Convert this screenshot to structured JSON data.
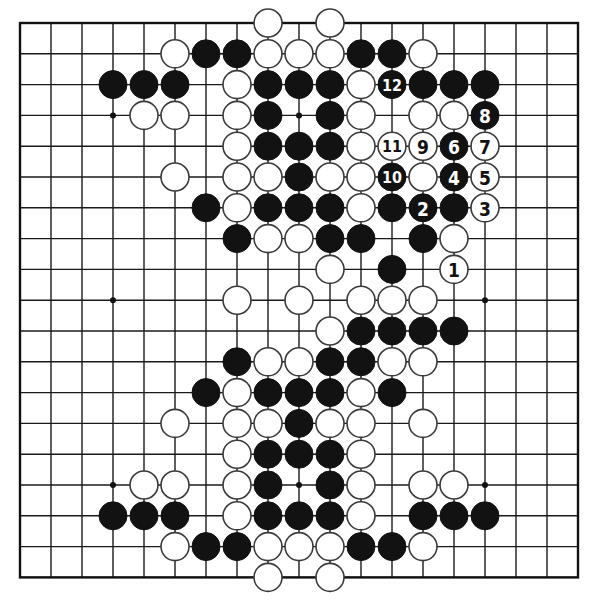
{
  "board": {
    "size": 19,
    "origin_x": 20,
    "origin_y": 23,
    "spacing_x": 31.0,
    "spacing_y": 30.8,
    "stone_radius": 14,
    "colors": {
      "black": "#121212",
      "white": "#ffffff",
      "line": "#1a1a1a",
      "background": "#ffffff"
    },
    "star_points": [
      [
        3,
        3
      ],
      [
        9,
        3
      ],
      [
        15,
        3
      ],
      [
        3,
        9
      ],
      [
        9,
        9
      ],
      [
        15,
        9
      ],
      [
        3,
        15
      ],
      [
        9,
        15
      ],
      [
        15,
        15
      ]
    ],
    "visible_star_points": [
      [
        3,
        3
      ],
      [
        9,
        3
      ],
      [
        3,
        9
      ],
      [
        15,
        9
      ],
      [
        3,
        15
      ],
      [
        9,
        15
      ],
      [
        15,
        15
      ]
    ]
  },
  "stones": {
    "black": [
      [
        6,
        1
      ],
      [
        7,
        1
      ],
      [
        11,
        1
      ],
      [
        12,
        1
      ],
      [
        3,
        2
      ],
      [
        4,
        2
      ],
      [
        5,
        2
      ],
      [
        8,
        2
      ],
      [
        9,
        2
      ],
      [
        10,
        2
      ],
      [
        13,
        2
      ],
      [
        14,
        2
      ],
      [
        15,
        2
      ],
      [
        8,
        3
      ],
      [
        10,
        3
      ],
      [
        8,
        4
      ],
      [
        9,
        4
      ],
      [
        10,
        4
      ],
      [
        9,
        5
      ],
      [
        6,
        6
      ],
      [
        8,
        6
      ],
      [
        9,
        6
      ],
      [
        10,
        6
      ],
      [
        12,
        6
      ],
      [
        14,
        6
      ],
      [
        7,
        7
      ],
      [
        10,
        7
      ],
      [
        11,
        7
      ],
      [
        13,
        7
      ],
      [
        12,
        8
      ],
      [
        11,
        10
      ],
      [
        12,
        10
      ],
      [
        13,
        10
      ],
      [
        14,
        10
      ],
      [
        7,
        11
      ],
      [
        10,
        11
      ],
      [
        11,
        11
      ],
      [
        6,
        12
      ],
      [
        8,
        12
      ],
      [
        9,
        12
      ],
      [
        10,
        12
      ],
      [
        12,
        12
      ],
      [
        9,
        13
      ],
      [
        8,
        14
      ],
      [
        9,
        14
      ],
      [
        10,
        14
      ],
      [
        8,
        15
      ],
      [
        10,
        15
      ],
      [
        3,
        16
      ],
      [
        4,
        16
      ],
      [
        5,
        16
      ],
      [
        8,
        16
      ],
      [
        9,
        16
      ],
      [
        10,
        16
      ],
      [
        13,
        16
      ],
      [
        14,
        16
      ],
      [
        15,
        16
      ],
      [
        6,
        17
      ],
      [
        7,
        17
      ],
      [
        11,
        17
      ],
      [
        12,
        17
      ]
    ],
    "white": [
      [
        8,
        0
      ],
      [
        10,
        0
      ],
      [
        5,
        1
      ],
      [
        8,
        1
      ],
      [
        9,
        1
      ],
      [
        10,
        1
      ],
      [
        13,
        1
      ],
      [
        7,
        2
      ],
      [
        11,
        2
      ],
      [
        4,
        3
      ],
      [
        5,
        3
      ],
      [
        7,
        3
      ],
      [
        11,
        3
      ],
      [
        13,
        3
      ],
      [
        14,
        3
      ],
      [
        7,
        4
      ],
      [
        11,
        4
      ],
      [
        5,
        5
      ],
      [
        7,
        5
      ],
      [
        8,
        5
      ],
      [
        10,
        5
      ],
      [
        11,
        5
      ],
      [
        13,
        5
      ],
      [
        7,
        6
      ],
      [
        11,
        6
      ],
      [
        8,
        7
      ],
      [
        9,
        7
      ],
      [
        14,
        7
      ],
      [
        10,
        8
      ],
      [
        7,
        9
      ],
      [
        9,
        9
      ],
      [
        11,
        9
      ],
      [
        12,
        9
      ],
      [
        13,
        9
      ],
      [
        10,
        10
      ],
      [
        8,
        11
      ],
      [
        9,
        11
      ],
      [
        12,
        11
      ],
      [
        13,
        11
      ],
      [
        7,
        12
      ],
      [
        11,
        12
      ],
      [
        5,
        13
      ],
      [
        7,
        13
      ],
      [
        8,
        13
      ],
      [
        10,
        13
      ],
      [
        11,
        13
      ],
      [
        13,
        13
      ],
      [
        7,
        14
      ],
      [
        11,
        14
      ],
      [
        4,
        15
      ],
      [
        5,
        15
      ],
      [
        7,
        15
      ],
      [
        11,
        15
      ],
      [
        13,
        15
      ],
      [
        14,
        15
      ],
      [
        7,
        16
      ],
      [
        11,
        16
      ],
      [
        5,
        17
      ],
      [
        8,
        17
      ],
      [
        9,
        17
      ],
      [
        10,
        17
      ],
      [
        13,
        17
      ],
      [
        8,
        18
      ],
      [
        10,
        18
      ]
    ]
  },
  "move_sequence": [
    {
      "n": "1",
      "color": "white",
      "pos": [
        14,
        8
      ]
    },
    {
      "n": "2",
      "color": "black",
      "pos": [
        13,
        6
      ]
    },
    {
      "n": "3",
      "color": "white",
      "pos": [
        15,
        6
      ]
    },
    {
      "n": "4",
      "color": "black",
      "pos": [
        14,
        5
      ]
    },
    {
      "n": "5",
      "color": "white",
      "pos": [
        15,
        5
      ]
    },
    {
      "n": "6",
      "color": "black",
      "pos": [
        14,
        4
      ]
    },
    {
      "n": "7",
      "color": "white",
      "pos": [
        15,
        4
      ]
    },
    {
      "n": "8",
      "color": "black",
      "pos": [
        15,
        3
      ]
    },
    {
      "n": "9",
      "color": "white",
      "pos": [
        13,
        4
      ]
    },
    {
      "n": "10",
      "color": "black",
      "pos": [
        12,
        5
      ]
    },
    {
      "n": "11",
      "color": "white",
      "pos": [
        12,
        4
      ]
    },
    {
      "n": "12",
      "color": "black",
      "pos": [
        12,
        2
      ]
    }
  ]
}
